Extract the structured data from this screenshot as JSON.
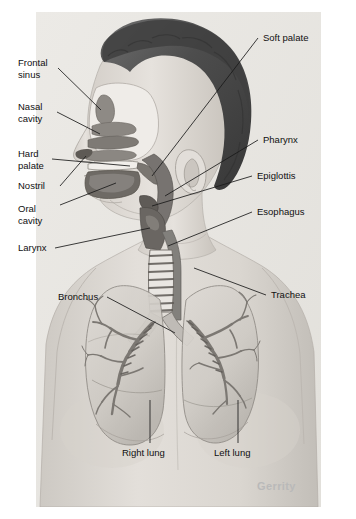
{
  "figure": {
    "watermark": "Gerrity",
    "background_color": "#ffffff",
    "illustration_bg_color": "#e8e6e2",
    "ink_color": "#101010",
    "skin_color": "#ded9d3",
    "hair_color": "#4a4a4a",
    "airway_color": "#6f6f6f",
    "lung_color": "#cfcbc6"
  },
  "labels": {
    "left": [
      {
        "id": "frontal-sinus",
        "line1": "Frontal",
        "line2": "sinus"
      },
      {
        "id": "nasal-cavity",
        "line1": "Nasal",
        "line2": "cavity"
      },
      {
        "id": "hard-palate",
        "line1": "Hard",
        "line2": "palate"
      },
      {
        "id": "nostril",
        "line1": "Nostril",
        "line2": ""
      },
      {
        "id": "oral-cavity",
        "line1": "Oral",
        "line2": "cavity"
      },
      {
        "id": "larynx",
        "line1": "Larynx",
        "line2": ""
      },
      {
        "id": "bronchus",
        "line1": "Bronchus",
        "line2": ""
      }
    ],
    "right": [
      {
        "id": "soft-palate",
        "line1": "Soft palate",
        "line2": ""
      },
      {
        "id": "pharynx",
        "line1": "Pharynx",
        "line2": ""
      },
      {
        "id": "epiglottis",
        "line1": "Epiglottis",
        "line2": ""
      },
      {
        "id": "esophagus",
        "line1": "Esophagus",
        "line2": ""
      },
      {
        "id": "trachea",
        "line1": "Trachea",
        "line2": ""
      }
    ],
    "bottom": [
      {
        "id": "right-lung",
        "line1": "Right lung",
        "line2": ""
      },
      {
        "id": "left-lung",
        "line1": "Left lung",
        "line2": ""
      }
    ]
  },
  "structures": [
    "frontal sinus",
    "nasal cavity",
    "hard palate",
    "soft palate",
    "nostril",
    "oral cavity",
    "pharynx",
    "epiglottis",
    "larynx",
    "esophagus",
    "trachea",
    "bronchus",
    "right lung",
    "left lung"
  ]
}
